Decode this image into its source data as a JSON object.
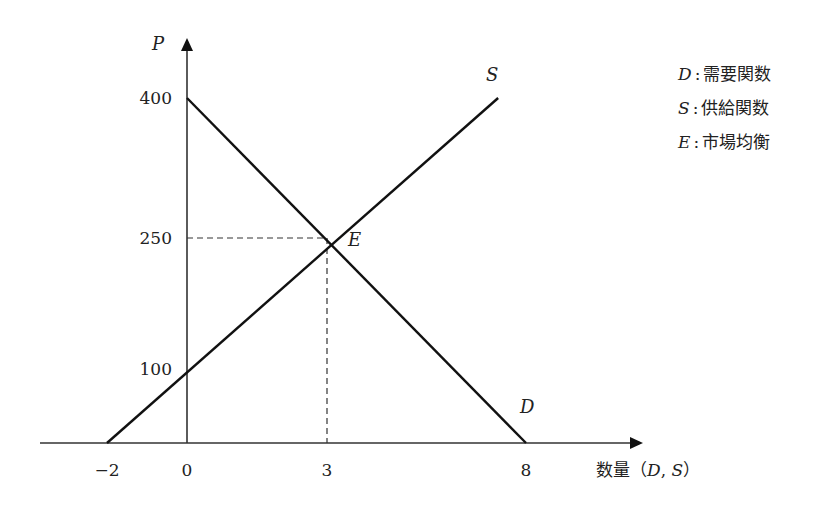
{
  "chart_data": {
    "type": "line",
    "title": "",
    "xlabel": "数量（D, S）",
    "xlabel_parts": {
      "prefix": "数量（",
      "var1": "D",
      "sep": ", ",
      "var2": "S",
      "suffix": "）"
    },
    "ylabel": "P",
    "x_ticks": [
      {
        "value": -2,
        "label": "−2"
      },
      {
        "value": 0,
        "label": "0"
      },
      {
        "value": 3,
        "label": "3"
      },
      {
        "value": 8,
        "label": "8"
      }
    ],
    "y_ticks": [
      {
        "value": 100,
        "label": "100"
      },
      {
        "value": 250,
        "label": "250"
      },
      {
        "value": 400,
        "label": "400"
      }
    ],
    "grid": false,
    "series": [
      {
        "name": "D",
        "label": "D",
        "description": "需要関数",
        "points": [
          {
            "x": 0,
            "y": 400
          },
          {
            "x": 8,
            "y": 0
          }
        ]
      },
      {
        "name": "S",
        "label": "S",
        "description": "供給関数",
        "points": [
          {
            "x": -2,
            "y": 0
          },
          {
            "x": 7.3,
            "y": 400
          }
        ]
      }
    ],
    "equilibrium": {
      "label": "E",
      "x": 3,
      "y": 250,
      "description": "市場均衡"
    },
    "legend": {
      "placement": "top-right",
      "entries": [
        {
          "symbol": "D",
          "sep": ":",
          "text": "需要関数"
        },
        {
          "symbol": "S",
          "sep": ":",
          "text": "供給関数"
        },
        {
          "symbol": "E",
          "sep": ":",
          "text": "市場均衡"
        }
      ]
    },
    "line_color": "#111111"
  }
}
